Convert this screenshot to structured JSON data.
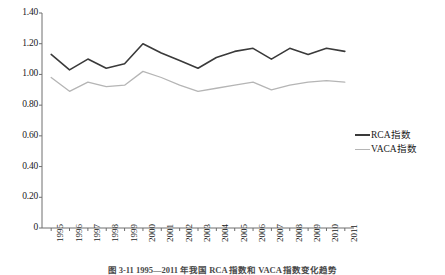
{
  "chart_data": {
    "type": "line",
    "title": "",
    "xlabel": "",
    "ylabel": "",
    "categories": [
      "1995",
      "1996",
      "1997",
      "1998",
      "1999",
      "2000",
      "2001",
      "2002",
      "2003",
      "2004",
      "2005",
      "2006",
      "2007",
      "2008",
      "2009",
      "2010",
      "2011"
    ],
    "series": [
      {
        "name": "RCA指数",
        "color": "#3a3a3a",
        "values": [
          1.13,
          1.03,
          1.1,
          1.04,
          1.07,
          1.2,
          1.14,
          1.09,
          1.04,
          1.11,
          1.15,
          1.17,
          1.1,
          1.17,
          1.13,
          1.17,
          1.15
        ]
      },
      {
        "name": "VACA指数",
        "color": "#b5b5b5",
        "values": [
          0.98,
          0.89,
          0.95,
          0.92,
          0.93,
          1.02,
          0.98,
          0.93,
          0.89,
          0.91,
          0.93,
          0.95,
          0.9,
          0.93,
          0.95,
          0.96,
          0.95
        ]
      }
    ],
    "ylim": [
      0,
      1.4
    ],
    "yticks": [
      0,
      0.2,
      0.4,
      0.6,
      0.8,
      1.0,
      1.2,
      1.4
    ],
    "ytick_labels": [
      "0",
      "0.20",
      "0.40",
      "0.60",
      "0.80",
      "1.00",
      "1.20",
      "1.40"
    ],
    "grid": false,
    "legend_position": "right"
  },
  "legend": {
    "items": [
      {
        "label": "RCA指数"
      },
      {
        "label": "VACA指数"
      }
    ]
  },
  "caption": {
    "text": "图 3-11  1995—2011 年我国 RCA 指数和 VACA 指数变化趋势"
  }
}
